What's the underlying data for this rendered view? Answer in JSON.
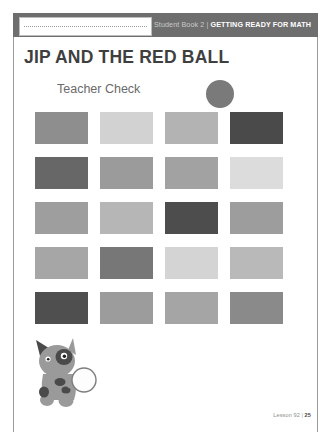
{
  "header": {
    "book_label": "Student Book 2",
    "separator": "|",
    "strand_label": "GETTING READY FOR MATH"
  },
  "name_box": {
    "value": "",
    "placeholder": ""
  },
  "title": "JIP AND THE RED BALL",
  "subtitle": "Teacher Check",
  "teacher_check_circle_color": "#7a7a7a",
  "footer": {
    "lesson_label": "Lesson 92",
    "separator": "|",
    "page_number": "25"
  },
  "illustration": {
    "name": "jip-the-dog",
    "body_color": "#9a9a9a",
    "spot_color": "#4a4a4a",
    "ball_color": "#fdfdfd",
    "ball_outline": "#7d7d7d"
  },
  "chart_data": {
    "type": "table",
    "rows": 5,
    "columns": 4,
    "values": [
      [
        "#8e8e8e",
        "#d2d2d2",
        "#b3b3b3",
        "#4a4a4a"
      ],
      [
        "#676767",
        "#9b9b9b",
        "#a2a2a2",
        "#dcdcdc"
      ],
      [
        "#9e9e9e",
        "#b6b6b6",
        "#4d4d4d",
        "#9d9d9d"
      ],
      [
        "#a6a6a6",
        "#777777",
        "#d4d4d4",
        "#b9b9b9"
      ],
      [
        "#4f4f4f",
        "#9c9c9c",
        "#a5a5a5",
        "#8a8a8a"
      ]
    ]
  }
}
